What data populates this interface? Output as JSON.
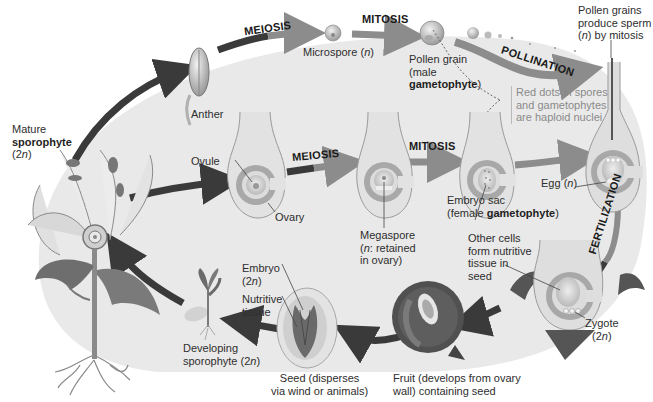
{
  "diagram": {
    "type": "life-cycle",
    "colors": {
      "background_oval": "#e8e8e8",
      "diploid_arrow": "#3a3a3a",
      "haploid_arrow": "#8c8c8c",
      "structure_fill": "#c9c9c9",
      "structure_dark": "#6e6e6e",
      "note_text": "#8a8a8a"
    },
    "processes": {
      "meiosis_top": "MEIOSIS",
      "mitosis_top": "MITOSIS",
      "pollination": "POLLINATION",
      "meiosis_mid": "MEIOSIS",
      "mitosis_mid": "MITOSIS",
      "fertilization": "FERTILIZATION"
    },
    "labels": {
      "mature_sporophyte": {
        "line1": "Mature",
        "line2": "sporophyte",
        "line3_pre": "(2",
        "line3_n": "n",
        "line3_post": ")"
      },
      "anther": "Anther",
      "microspore": {
        "pre": "Microspore (",
        "n": "n",
        "post": ")"
      },
      "pollen_grain": {
        "line1": "Pollen grain",
        "line2": "(male",
        "line3_bold": "gametophyte",
        "line3_post": ")"
      },
      "pollen_sperm": {
        "line1": "Pollen grains",
        "line2": "produce sperm",
        "line3_pre": "(",
        "line3_n": "n",
        "line3_post": ") by mitosis"
      },
      "haploid_note": {
        "line1": "Red dots in spores",
        "line2": "and gametophytes",
        "line3": "are haploid nuclei"
      },
      "ovule": "Ovule",
      "ovary": "Ovary",
      "megaspore": {
        "line1": "Megaspore",
        "line2_pre": "(",
        "line2_n": "n",
        "line2_post": ": retained",
        "line3": "in ovary)"
      },
      "embryo_sac": {
        "line1": "Embryo sac",
        "line2_pre": "(female ",
        "line2_bold": "gametophyte",
        "line2_post": ")"
      },
      "egg": {
        "pre": "Egg (",
        "n": "n",
        "post": ")"
      },
      "other_cells": {
        "line1": "Other cells",
        "line2": "form nutritive",
        "line3": "tissue in",
        "line4": "seed"
      },
      "zygote": {
        "line1": "Zygote",
        "line2_pre": "(2",
        "line2_n": "n",
        "line2_post": ")"
      },
      "fruit": {
        "line1": "Fruit (develops from ovary",
        "line2": "wall) containing seed"
      },
      "seed": {
        "line1": "Seed (disperses",
        "line2": "via wind or animals)"
      },
      "embryo": {
        "line1": "Embryo",
        "line2_pre": "(2",
        "line2_n": "n",
        "line2_post": ")"
      },
      "nutritive_tissue": {
        "line1": "Nutritive",
        "line2": "tissue"
      },
      "developing_sporophyte": {
        "line1": "Developing",
        "line2_pre": "sporophyte (2",
        "line2_n": "n",
        "line2_post": ")"
      }
    }
  }
}
